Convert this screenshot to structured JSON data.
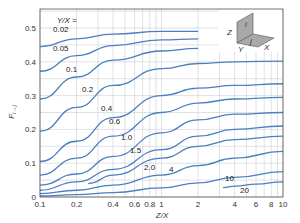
{
  "chart_data": {
    "type": "line",
    "title": "",
    "xlabel": "Z/X",
    "ylabel": "F(i-j)",
    "xscale": "log",
    "xlim": [
      0.1,
      10
    ],
    "ylim": [
      0,
      0.55
    ],
    "grid": true,
    "legend_title": "Y/X =",
    "x_ticks": [
      0.1,
      0.2,
      0.4,
      0.6,
      0.8,
      1,
      2,
      4,
      6,
      8,
      10
    ],
    "x_tick_labels": [
      "0.1",
      "0.2",
      "0.4",
      "0.6",
      "0.8",
      "1",
      "2",
      "4",
      "6",
      "8",
      "10"
    ],
    "y_ticks": [
      0,
      0.1,
      0.2,
      0.3,
      0.4,
      0.5
    ],
    "y_tick_labels": [
      "0",
      "0.1",
      "0.2",
      "0.3",
      "0.4",
      "0.5"
    ],
    "series": [
      {
        "name": "0.02",
        "label": "0.02",
        "x": [
          0.1,
          0.2,
          0.4,
          1,
          2
        ],
        "values": [
          0.445,
          0.468,
          0.482,
          0.49,
          0.49
        ]
      },
      {
        "name": "0.05",
        "label": "0.05",
        "x": [
          0.1,
          0.2,
          0.4,
          1,
          2
        ],
        "values": [
          0.372,
          0.418,
          0.448,
          0.465,
          0.468
        ]
      },
      {
        "name": "0.1",
        "label": "0.1",
        "x": [
          0.1,
          0.2,
          0.4,
          1,
          2
        ],
        "values": [
          0.29,
          0.355,
          0.405,
          0.432,
          0.44
        ]
      },
      {
        "name": "0.2",
        "label": "0.2",
        "x": [
          0.1,
          0.2,
          0.4,
          1,
          2,
          4,
          10
        ],
        "values": [
          0.195,
          0.265,
          0.33,
          0.38,
          0.395,
          0.4,
          0.402
        ]
      },
      {
        "name": "0.4",
        "label": "0.4",
        "x": [
          0.1,
          0.2,
          0.4,
          1,
          2,
          4,
          10
        ],
        "values": [
          0.105,
          0.165,
          0.235,
          0.3,
          0.322,
          0.33,
          0.335
        ]
      },
      {
        "name": "0.6",
        "label": "0.6",
        "x": [
          0.1,
          0.2,
          0.4,
          1,
          2,
          4,
          10
        ],
        "values": [
          0.065,
          0.115,
          0.18,
          0.25,
          0.278,
          0.29,
          0.295
        ]
      },
      {
        "name": "1.0",
        "label": "1.0",
        "x": [
          0.1,
          0.2,
          0.4,
          1,
          2,
          4,
          10
        ],
        "values": [
          0.035,
          0.068,
          0.12,
          0.19,
          0.228,
          0.245,
          0.25
        ]
      },
      {
        "name": "1.5",
        "label": "1.5",
        "x": [
          0.1,
          0.2,
          0.4,
          1,
          2,
          4,
          10
        ],
        "values": [
          0.02,
          0.045,
          0.082,
          0.14,
          0.18,
          0.2,
          0.21
        ]
      },
      {
        "name": "2.0",
        "label": "2.0",
        "x": [
          0.25,
          0.4,
          1,
          2,
          4,
          10
        ],
        "values": [
          0.04,
          0.065,
          0.115,
          0.15,
          0.17,
          0.18
        ]
      },
      {
        "name": "4",
        "label": "4",
        "x": [
          0.1,
          0.2,
          0.4,
          1,
          2,
          4,
          10
        ],
        "values": [
          0.01,
          0.02,
          0.035,
          0.065,
          0.093,
          0.115,
          0.135
        ]
      },
      {
        "name": "10",
        "label": "10",
        "x": [
          0.1,
          0.2,
          0.4,
          1,
          2,
          4,
          10
        ],
        "values": [
          0.003,
          0.007,
          0.013,
          0.027,
          0.042,
          0.058,
          0.075
        ]
      },
      {
        "name": "20",
        "label": "20",
        "x": [
          3.2,
          4,
          6,
          10
        ],
        "values": [
          0.028,
          0.032,
          0.038,
          0.045
        ]
      }
    ],
    "annotations": [
      "Y/X =",
      "inset: perpendicular plates diagram with labels Z, Y, X, i, j"
    ]
  },
  "inset": {
    "labels": {
      "z": "Z",
      "y": "Y",
      "x": "X",
      "i": "i",
      "j": "j"
    }
  },
  "colors": {
    "curve": "#4a7fc0",
    "grid": "#c9ccd2",
    "frame": "#555555",
    "plate": "#a9a9a9"
  }
}
